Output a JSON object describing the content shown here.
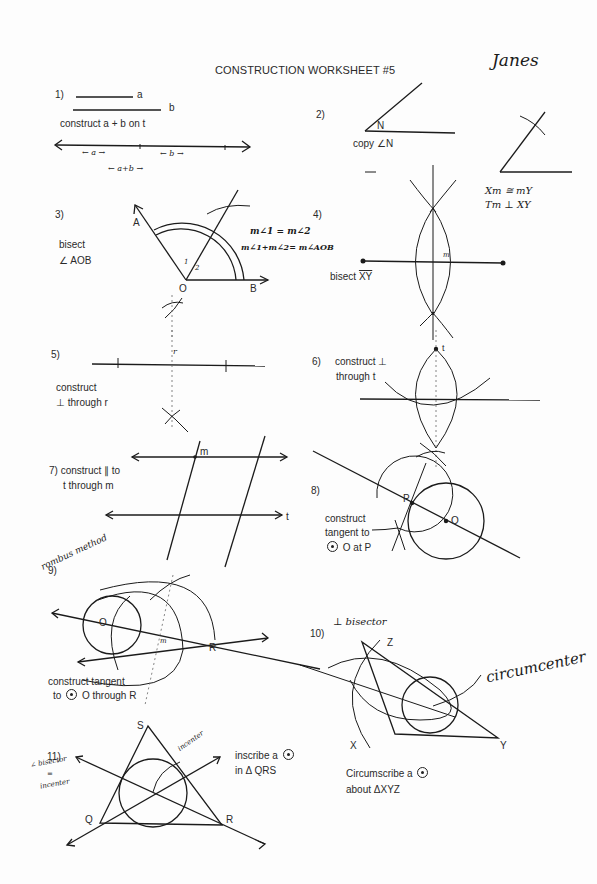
{
  "header": {
    "title": "CONSTRUCTION WORKSHEET #5",
    "student_name": "Janes"
  },
  "problems": [
    {
      "number": "1)",
      "segment_labels": [
        "a",
        "b"
      ],
      "instruction": "construct a + b on t",
      "handwritten_labels": [
        "← a →",
        "← b →",
        "← a+b →"
      ]
    },
    {
      "number": "2)",
      "vertex_label": "N",
      "instruction": "copy ∠N"
    },
    {
      "number": "3)",
      "instruction_line1": "bisect",
      "instruction_line2": "∠ AOB",
      "point_labels": [
        "A",
        "O",
        "B"
      ],
      "angle_marks": [
        "1",
        "2"
      ],
      "handwritten_notes": [
        "m∠1 = m∠2",
        "m∠1+m∠2= m∠AOB"
      ]
    },
    {
      "number": "4)",
      "instruction": "bisect",
      "segment": "XY",
      "midpoint_label": "m",
      "handwritten_notes": [
        "Xm ≅ mY",
        "Tm ⊥ XY"
      ]
    },
    {
      "number": "5)",
      "instruction_line1": "construct",
      "instruction_line2": "⊥ through r",
      "point_label": "r"
    },
    {
      "number": "6)",
      "instruction_line1": "construct ⊥",
      "instruction_line2": "through t",
      "point_label": "t"
    },
    {
      "number": "7)",
      "instruction_line1": "construct  ∥ to",
      "instruction_line2": "t through m",
      "point_label": "m",
      "line_label": "t"
    },
    {
      "number": "8)",
      "instruction_line1": "construct",
      "instruction_line2": "tangent to",
      "instruction_line3": "O at P",
      "point_labels": [
        "P",
        "O"
      ]
    },
    {
      "number": "9)",
      "handwritten_note": "rombus method",
      "instruction_line1": "construct tangent",
      "instruction_line2_pre": "to",
      "instruction_line2_post": "O through R",
      "point_labels": [
        "O",
        "R"
      ],
      "mark": "m"
    },
    {
      "number": "10)",
      "handwritten_note": "⊥ bisector",
      "handwritten_label": "circumcenter",
      "point_labels": [
        "Z",
        "X",
        "Y"
      ],
      "instruction_line1": "Circumscribe a",
      "instruction_line2": "about  ΔXYZ"
    },
    {
      "number": "11)",
      "handwritten_note_lines": [
        "∠ bisector",
        "=",
        "incenter"
      ],
      "handwritten_label": "incenter",
      "point_labels": [
        "S",
        "Q",
        "R"
      ],
      "instruction_line1": "inscribe a",
      "instruction_line2": "in Δ QRS"
    }
  ]
}
